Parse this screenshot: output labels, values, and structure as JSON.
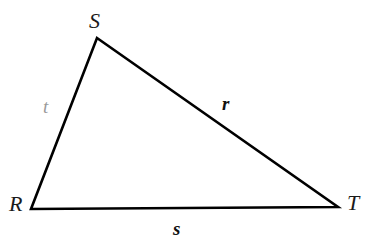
{
  "figure": {
    "kind": "geometry-diagram",
    "shape": "triangle",
    "background_color": "#ffffff",
    "stroke_color": "#000000",
    "stroke_width": 2.6,
    "width": 374,
    "height": 246
  },
  "vertices": [
    {
      "id": "S",
      "label": "S",
      "x": 97,
      "y": 38,
      "label_x": 89,
      "label_y": 10,
      "color": "#1a1a1a"
    },
    {
      "id": "R",
      "label": "R",
      "x": 31,
      "y": 209,
      "label_x": 9,
      "label_y": 193,
      "color": "#1a1a1a"
    },
    {
      "id": "T",
      "label": "T",
      "x": 338,
      "y": 207,
      "label_x": 347,
      "label_y": 192,
      "color": "#1a1a1a"
    }
  ],
  "sides": [
    {
      "id": "t",
      "label": "t",
      "between": "R-S",
      "style": "italic",
      "weight": "regular",
      "color": "#9a9a9a",
      "label_x": 43,
      "label_y": 97
    },
    {
      "id": "r",
      "label": "r",
      "between": "S-T",
      "style": "italic",
      "weight": "bold",
      "color": "#111111",
      "label_x": 222,
      "label_y": 94
    },
    {
      "id": "s",
      "label": "s",
      "between": "R-T",
      "style": "italic",
      "weight": "bold",
      "color": "#111111",
      "label_x": 173,
      "label_y": 219
    }
  ],
  "path": {
    "points": "97,38 338,207 31,209 97,38"
  }
}
